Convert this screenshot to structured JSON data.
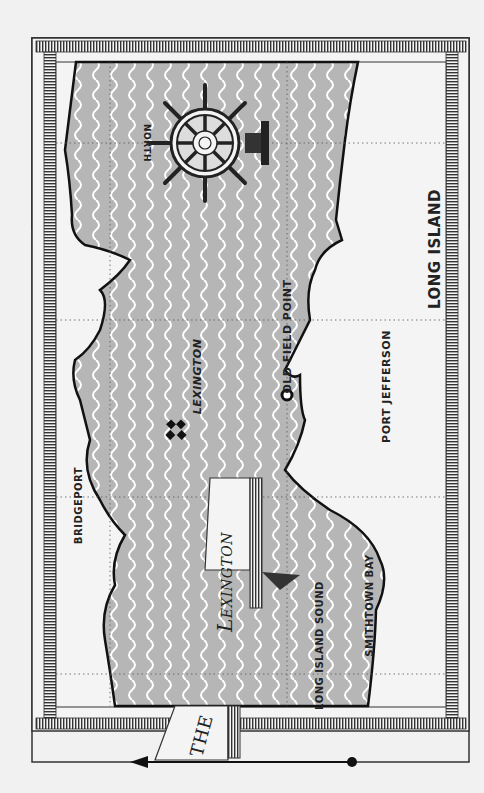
{
  "map": {
    "title_line1": "THE",
    "title_line2": "Lexington",
    "compass_label": "NORTH",
    "colors": {
      "water": "#b6b6b6",
      "wave": "#ffffff",
      "land": "#f4f4f4",
      "coast": "#111111",
      "frame": "#333333"
    },
    "labels": {
      "bridgeport": "BRIDGEPORT",
      "lexington_wreck": "LEXINGTON",
      "old_field_point": "OLD FIELD POINT",
      "port_jefferson": "PORT JEFFERSON",
      "long_island": "LONG ISLAND",
      "long_island_sound": "LONG ISLAND SOUND",
      "smithtown_bay": "SMITHTOWN BAY",
      "north": "NORTH"
    },
    "markers": [
      {
        "name": "wreck-marker",
        "label": "LEXINGTON",
        "symbol": "four-diamond"
      },
      {
        "name": "old-field-point-marker",
        "label": "OLD FIELD POINT",
        "symbol": "circle"
      }
    ]
  }
}
